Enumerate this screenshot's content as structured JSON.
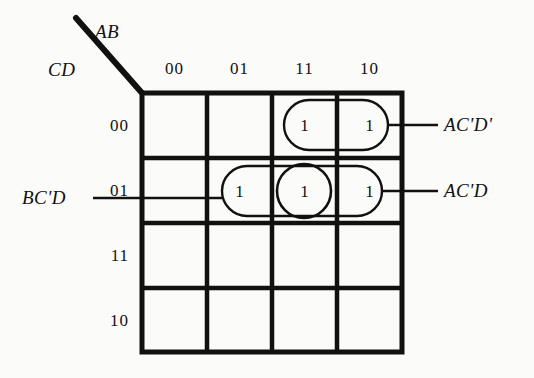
{
  "diagram": {
    "kind": "karnaugh-map",
    "variables": {
      "columns_label": "AB",
      "rows_label": "CD"
    },
    "column_headers": [
      "00",
      "01",
      "11",
      "10"
    ],
    "row_headers": [
      "00",
      "01",
      "11",
      "10"
    ],
    "cells": [
      {
        "row": "00",
        "col": "00",
        "value": ""
      },
      {
        "row": "00",
        "col": "01",
        "value": ""
      },
      {
        "row": "00",
        "col": "11",
        "value": "1"
      },
      {
        "row": "00",
        "col": "10",
        "value": "1"
      },
      {
        "row": "01",
        "col": "00",
        "value": ""
      },
      {
        "row": "01",
        "col": "01",
        "value": "1"
      },
      {
        "row": "01",
        "col": "11",
        "value": "1"
      },
      {
        "row": "01",
        "col": "10",
        "value": "1"
      },
      {
        "row": "11",
        "col": "00",
        "value": ""
      },
      {
        "row": "11",
        "col": "01",
        "value": ""
      },
      {
        "row": "11",
        "col": "11",
        "value": ""
      },
      {
        "row": "11",
        "col": "10",
        "value": ""
      },
      {
        "row": "10",
        "col": "00",
        "value": ""
      },
      {
        "row": "10",
        "col": "01",
        "value": ""
      },
      {
        "row": "10",
        "col": "11",
        "value": ""
      },
      {
        "row": "10",
        "col": "10",
        "value": ""
      }
    ],
    "groups": [
      {
        "id": "g1",
        "label": "AC'D'",
        "shape": "stadium",
        "covers": [
          "00/11",
          "00/10"
        ],
        "label_side": "right"
      },
      {
        "id": "g2",
        "label": "AC'D",
        "shape": "stadium",
        "covers": [
          "01/01",
          "01/11",
          "01/10"
        ],
        "label_side": "right"
      },
      {
        "id": "g3",
        "label": "BC'D",
        "shape": "circle",
        "covers": [
          "01/11"
        ],
        "label_side": "left"
      }
    ],
    "ones": [
      {
        "text": "1",
        "row": "00",
        "col": "11"
      },
      {
        "text": "1",
        "row": "00",
        "col": "10"
      },
      {
        "text": "1",
        "row": "01",
        "col": "01"
      },
      {
        "text": "1",
        "row": "01",
        "col": "11"
      },
      {
        "text": "1",
        "row": "01",
        "col": "10"
      }
    ],
    "colors": {
      "ink": "#111111",
      "paper": "#fbfbf9",
      "group_outline": "#111111"
    }
  }
}
